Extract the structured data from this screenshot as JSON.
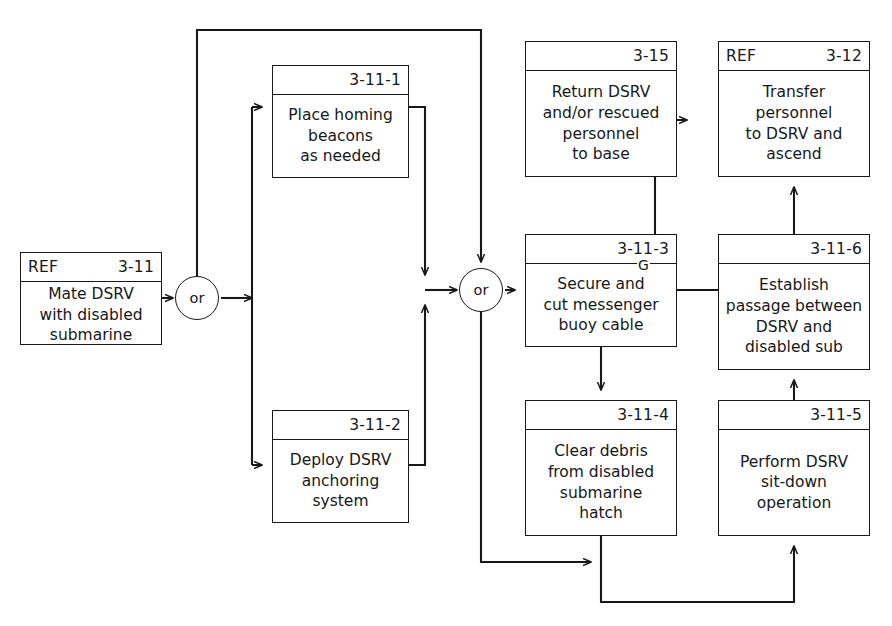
{
  "diagram": {
    "type": "functional-flow-block-diagram",
    "canvas": {
      "width": 892,
      "height": 626
    },
    "line_color": "#16181a",
    "background_color": "#ffffff"
  },
  "nodes": [
    {
      "id": "ref-3-11",
      "ref": "REF",
      "number": "3-11",
      "text": "Mate DSRV\nwith disabled\nsubmarine",
      "x": 20,
      "y": 252,
      "w": 142,
      "h": 93
    },
    {
      "id": "n-3-11-1",
      "ref": "",
      "number": "3-11-1",
      "text": "Place homing\nbeacons\nas needed",
      "x": 272,
      "y": 65,
      "w": 137,
      "h": 113
    },
    {
      "id": "n-3-11-2",
      "ref": "",
      "number": "3-11-2",
      "text": "Deploy DSRV\nanchoring\nsystem",
      "x": 272,
      "y": 410,
      "w": 137,
      "h": 113
    },
    {
      "id": "n-3-15",
      "ref": "",
      "number": "3-15",
      "text": "Return DSRV\nand/or rescued\npersonnel\nto base",
      "x": 525,
      "y": 41,
      "w": 152,
      "h": 136
    },
    {
      "id": "ref-3-12",
      "ref": "REF",
      "number": "3-12",
      "text": "Transfer\npersonnel\nto DSRV and\nascend",
      "x": 718,
      "y": 41,
      "w": 152,
      "h": 136
    },
    {
      "id": "n-3-11-3",
      "ref": "",
      "number": "3-11-3",
      "text": "Secure and\ncut messenger\nbuoy cable",
      "x": 525,
      "y": 234,
      "w": 152,
      "h": 113
    },
    {
      "id": "n-3-11-6",
      "ref": "",
      "number": "3-11-6",
      "text": "Establish\npassage between\nDSRV and\ndisabled sub",
      "x": 718,
      "y": 234,
      "w": 152,
      "h": 136
    },
    {
      "id": "n-3-11-4",
      "ref": "",
      "number": "3-11-4",
      "text": "Clear debris\nfrom disabled\nsubmarine\nhatch",
      "x": 525,
      "y": 400,
      "w": 152,
      "h": 136
    },
    {
      "id": "n-3-11-5",
      "ref": "",
      "number": "3-11-5",
      "text": "Perform DSRV\nsit-down\noperation",
      "x": 718,
      "y": 400,
      "w": 152,
      "h": 136
    }
  ],
  "gates": [
    {
      "id": "or-left",
      "label": "or",
      "cx": 197,
      "cy": 298
    },
    {
      "id": "or-right",
      "label": "or",
      "cx": 481,
      "cy": 290
    }
  ],
  "edge_labels": [
    {
      "id": "label-g",
      "text": "G",
      "x": 637,
      "y": 258
    }
  ],
  "flow_sequence": [
    "REF 3-11 Mate DSRV with disabled submarine",
    "or",
    "3-11-1 Place homing beacons as needed",
    "3-11-2 Deploy DSRV anchoring system",
    "or",
    "3-11-3 Secure and cut messenger buoy cable",
    "3-11-4 Clear debris from disabled submarine hatch",
    "3-11-5 Perform DSRV sit-down operation",
    "3-11-6 Establish passage between DSRV and disabled sub",
    "REF 3-12 Transfer personnel to DSRV and ascend",
    "3-15 Return DSRV and/or rescued personnel to base"
  ]
}
